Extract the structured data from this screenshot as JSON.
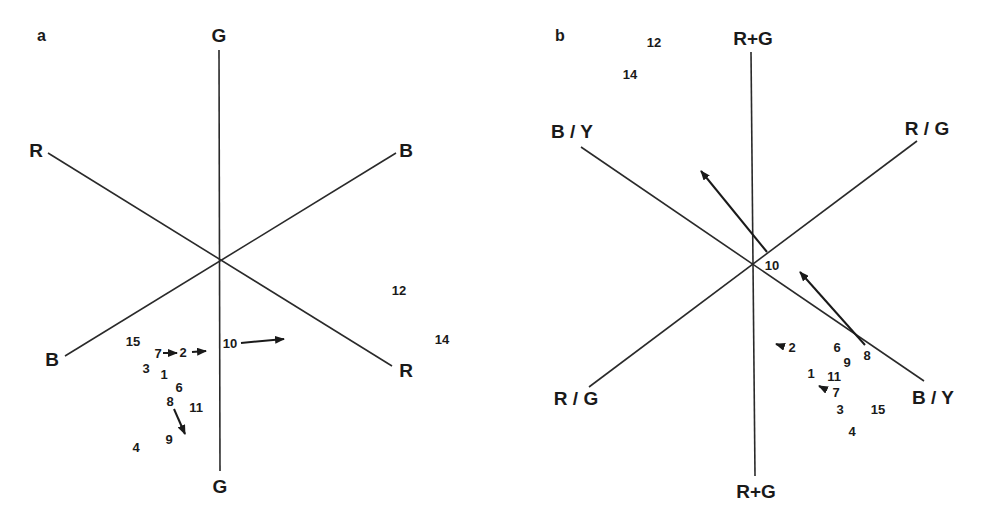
{
  "panels": [
    {
      "id": "a",
      "label": "a",
      "axes": {
        "vertical": "G",
        "vertical_bottom": "G",
        "upper_left": "R",
        "lower_right": "R",
        "upper_right": "B",
        "lower_left": "B"
      },
      "points": [
        {
          "id": "1",
          "label": "1"
        },
        {
          "id": "2",
          "label": "2"
        },
        {
          "id": "3",
          "label": "3"
        },
        {
          "id": "4",
          "label": "4"
        },
        {
          "id": "6",
          "label": "6"
        },
        {
          "id": "7",
          "label": "7"
        },
        {
          "id": "8",
          "label": "8"
        },
        {
          "id": "9",
          "label": "9"
        },
        {
          "id": "10",
          "label": "10"
        },
        {
          "id": "11",
          "label": "11"
        },
        {
          "id": "12",
          "label": "12"
        },
        {
          "id": "14",
          "label": "14"
        },
        {
          "id": "15",
          "label": "15"
        }
      ]
    },
    {
      "id": "b",
      "label": "b",
      "axes": {
        "vertical": "R+G",
        "vertical_bottom": "R+G",
        "upper_left": "B / Y",
        "lower_right": "B / Y",
        "upper_right": "R / G",
        "lower_left": "R / G"
      },
      "points": [
        {
          "id": "1",
          "label": "1"
        },
        {
          "id": "2",
          "label": "2"
        },
        {
          "id": "3",
          "label": "3"
        },
        {
          "id": "4",
          "label": "4"
        },
        {
          "id": "6",
          "label": "6"
        },
        {
          "id": "7",
          "label": "7"
        },
        {
          "id": "8",
          "label": "8"
        },
        {
          "id": "9",
          "label": "9"
        },
        {
          "id": "10",
          "label": "10"
        },
        {
          "id": "11",
          "label": "11"
        },
        {
          "id": "12",
          "label": "12"
        },
        {
          "id": "14",
          "label": "14"
        },
        {
          "id": "15",
          "label": "15"
        }
      ]
    }
  ]
}
